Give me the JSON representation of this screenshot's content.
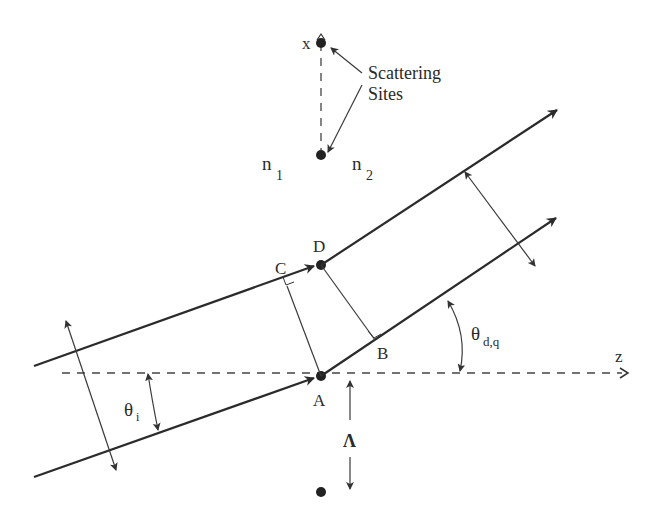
{
  "diagram": {
    "axes": {
      "x_label": "x",
      "z_label": "z"
    },
    "media": {
      "n1": {
        "base": "n",
        "sub": "1"
      },
      "n2": {
        "base": "n",
        "sub": "2"
      }
    },
    "annotation": {
      "line1": "Scattering",
      "line2": "Sites"
    },
    "points": {
      "A": "A",
      "B": "B",
      "C": "C",
      "D": "D"
    },
    "angles": {
      "incident": {
        "base": "θ",
        "sub": "i"
      },
      "diffracted": {
        "base": "θ",
        "sub": "d,q"
      }
    },
    "period": "Λ",
    "colors": {
      "stroke": "#2b2b2b",
      "text": "#2a2a2a",
      "background": "#ffffff"
    }
  }
}
